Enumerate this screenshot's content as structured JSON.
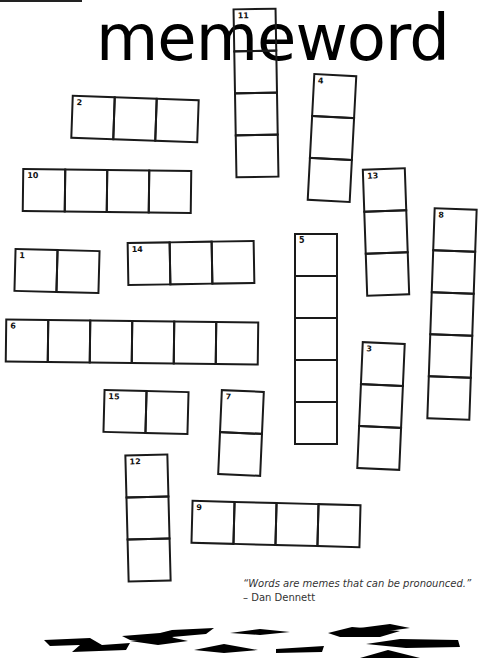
{
  "header": {
    "title": "memeword",
    "top_text": ""
  },
  "puzzle": {
    "clues": [
      {
        "number": "1",
        "direction": "across",
        "length": 2
      },
      {
        "number": "2",
        "direction": "across",
        "length": 3
      },
      {
        "number": "3",
        "direction": "down",
        "length": 3
      },
      {
        "number": "4",
        "direction": "down",
        "length": 3
      },
      {
        "number": "5",
        "direction": "down",
        "length": 5
      },
      {
        "number": "6",
        "direction": "across",
        "length": 6
      },
      {
        "number": "7",
        "direction": "down",
        "length": 2
      },
      {
        "number": "8",
        "direction": "down",
        "length": 5
      },
      {
        "number": "9",
        "direction": "across",
        "length": 4
      },
      {
        "number": "10",
        "direction": "across",
        "length": 4
      },
      {
        "number": "11",
        "direction": "down",
        "length": 4
      },
      {
        "number": "12",
        "direction": "down",
        "length": 3
      },
      {
        "number": "13",
        "direction": "down",
        "length": 3
      },
      {
        "number": "14",
        "direction": "across",
        "length": 3
      },
      {
        "number": "15",
        "direction": "across",
        "length": 2
      }
    ]
  },
  "quote": {
    "text": "“Words are memes that can be pronounced.”",
    "author": "– Dan Dennett"
  },
  "colors": {
    "ink": "#1a1a1a",
    "background": "#ffffff",
    "quote": "#333333"
  }
}
